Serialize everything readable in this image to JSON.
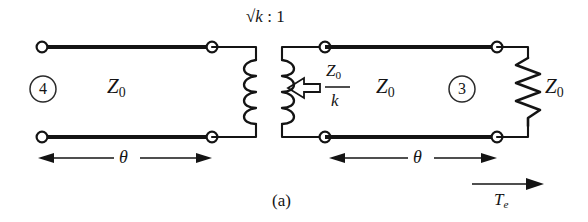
{
  "figure": {
    "caption": "(a)",
    "kind": "transmission-line-transformer-circuit-diagram"
  },
  "labels": {
    "transformer_ratio_root": "√k",
    "transformer_ratio_sep": " : ",
    "transformer_ratio_second": "1",
    "impedance_left": "Z",
    "impedance_left_sub": "0",
    "impedance_middle": "Z",
    "impedance_middle_sub": "0",
    "impedance_load": "Z",
    "impedance_load_sub": "0",
    "port_left": "4",
    "port_right": "3",
    "looking_in_numerator": "Z",
    "looking_in_numerator_sub": "0",
    "looking_in_denominator": "k",
    "theta_left": "θ",
    "theta_right": "θ",
    "transmission_coeff": "T",
    "transmission_coeff_sub": "e"
  },
  "colors": {
    "ink": "#141414",
    "background": "#ffffff"
  }
}
